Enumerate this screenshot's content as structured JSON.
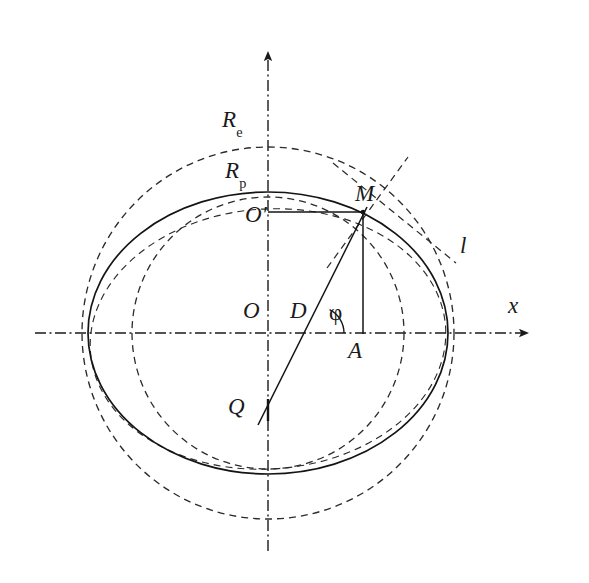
{
  "figure": {
    "background_color": "#ffffff",
    "line_color": "#1a1a1a"
  },
  "axes": {
    "x_axis": {
      "label": "x",
      "arrow": "right",
      "style": "dash-dot",
      "y_px": 333,
      "x_start_px": 35,
      "x_end_px": 535
    },
    "y_axis": {
      "label": "",
      "arrow": "up",
      "style": "dash-dot",
      "x_px": 268,
      "y_start_px": 45,
      "y_end_px": 551
    }
  },
  "labels": [
    {
      "id": "Re",
      "base": "R",
      "sub": "e",
      "x": 222,
      "y": 108,
      "meaning": "equatorial-radius"
    },
    {
      "id": "Rp",
      "base": "R",
      "sub": "p",
      "x": 225,
      "y": 159,
      "meaning": "polar-radius"
    },
    {
      "id": "Oprime",
      "base": "O",
      "sub": "",
      "suffix": "′",
      "x": 245,
      "y": 203,
      "meaning": "auxiliary-center"
    },
    {
      "id": "M",
      "base": "M",
      "sub": "",
      "x": 355,
      "y": 182,
      "meaning": "point-on-ellipse"
    },
    {
      "id": "l",
      "base": "l",
      "sub": "",
      "x": 460,
      "y": 234,
      "meaning": "tangent-line"
    },
    {
      "id": "O",
      "base": "O",
      "sub": "",
      "x": 243,
      "y": 299,
      "meaning": "origin"
    },
    {
      "id": "D",
      "base": "D",
      "sub": "",
      "x": 290,
      "y": 299,
      "meaning": "point-on-x-axis"
    },
    {
      "id": "phi",
      "base": "φ",
      "sub": "",
      "x": 329,
      "y": 301,
      "meaning": "latitude-angle"
    },
    {
      "id": "A",
      "base": "A",
      "sub": "",
      "x": 348,
      "y": 339,
      "meaning": "foot-of-perpendicular"
    },
    {
      "id": "Q",
      "base": "Q",
      "sub": "",
      "x": 228,
      "y": 395,
      "meaning": "point-on-y-axis"
    },
    {
      "id": "x",
      "base": "x",
      "sub": "",
      "x": 508,
      "y": 294,
      "meaning": "x-axis-label"
    }
  ],
  "curves": {
    "ellipse_solid": {
      "name": "meridian-ellipse",
      "cx": 268,
      "cy": 333,
      "rx": 180,
      "ry": 140,
      "stroke": "#1a1a1a",
      "stroke_width": 1.6,
      "dashed": false
    },
    "circle_outer_dashed": {
      "name": "equatorial-circle",
      "cx": 268,
      "cy": 333,
      "rx": 188,
      "ry": 188,
      "stroke": "#2a2a2a",
      "stroke_width": 1.3,
      "dashed": true,
      "note": "large dashed circle of radius R_e"
    },
    "circle_inner_dashed": {
      "name": "polar-circle",
      "cx": 268,
      "cy": 333,
      "rx": 136,
      "ry": 136,
      "stroke": "#2a2a2a",
      "stroke_width": 1.3,
      "dashed": true,
      "note": "smaller dashed circle of radius R_p"
    },
    "ellipse_dashed_inner": {
      "name": "auxiliary-dashed-ellipse",
      "cx": 268,
      "cy": 338,
      "rx": 178,
      "ry": 132,
      "rotation_deg": -4,
      "stroke": "#2a2a2a",
      "stroke_width": 1.1,
      "dashed": true
    }
  },
  "points": {
    "M": {
      "x": 363,
      "y": 212
    },
    "A": {
      "x": 363,
      "y": 333
    },
    "D": {
      "x": 318,
      "y": 333
    },
    "O": {
      "x": 268,
      "y": 333
    },
    "Oprime": {
      "x": 268,
      "y": 212
    },
    "Q": {
      "x": 268,
      "y": 410
    }
  },
  "segments": [
    {
      "name": "O-prime-to-M-horizontal",
      "x1": 268,
      "y1": 212,
      "x2": 363,
      "y2": 212
    },
    {
      "name": "M-to-A-vertical",
      "x1": 363,
      "y1": 212,
      "x2": 363,
      "y2": 333
    },
    {
      "name": "Q-to-M-oblique",
      "x1": 259,
      "y1": 424,
      "x2": 366,
      "y2": 208
    },
    {
      "name": "Q-marker-vertical",
      "x1": 268,
      "y1": 400,
      "x2": 268,
      "y2": 420
    }
  ],
  "dashed_lines": [
    {
      "name": "normal-line-at-M",
      "x1": 330,
      "y1": 262,
      "x2": 405,
      "y2": 160,
      "note": "dashed line through M going up-right"
    },
    {
      "name": "tangent-line-l",
      "x1": 335,
      "y1": 165,
      "x2": 455,
      "y2": 262,
      "note": "dashed tangent l touching ellipse right of M"
    }
  ],
  "angle": {
    "name": "phi-angle-arc",
    "vertex": {
      "x": 318,
      "y": 333
    },
    "symbol": "φ",
    "radius_px": 26,
    "start_deg": 0,
    "end_deg": 64
  }
}
